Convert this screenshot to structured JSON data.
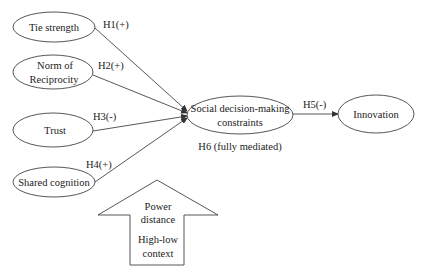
{
  "diagram": {
    "type": "research-model",
    "nodes": {
      "tie_strength": {
        "lines": [
          "Tie strength"
        ]
      },
      "norm_of_reciprocity": {
        "lines": [
          "Norm of",
          "Reciprocity"
        ]
      },
      "trust": {
        "lines": [
          "Trust"
        ]
      },
      "shared_cognition": {
        "lines": [
          "Shared cognition"
        ]
      },
      "social_constraints": {
        "lines": [
          "Social decision-making",
          "constraints"
        ]
      },
      "innovation": {
        "lines": [
          "Innovation"
        ]
      }
    },
    "edges": [
      {
        "from": "tie_strength",
        "to": "social_constraints",
        "label": "H1(+)"
      },
      {
        "from": "norm_of_reciprocity",
        "to": "social_constraints",
        "label": "H2(+)"
      },
      {
        "from": "trust",
        "to": "social_constraints",
        "label": "H3(-)"
      },
      {
        "from": "shared_cognition",
        "to": "social_constraints",
        "label": "H4(+)"
      },
      {
        "from": "social_constraints",
        "to": "innovation",
        "label": "H5(-)"
      }
    ],
    "mediation_note": "H6 (fully mediated)",
    "moderator": {
      "lines": [
        "Power",
        "distance",
        "",
        "High-low",
        "context"
      ]
    },
    "colors": {
      "stroke": "#333333",
      "text": "#222222",
      "background": "#ffffff"
    }
  }
}
